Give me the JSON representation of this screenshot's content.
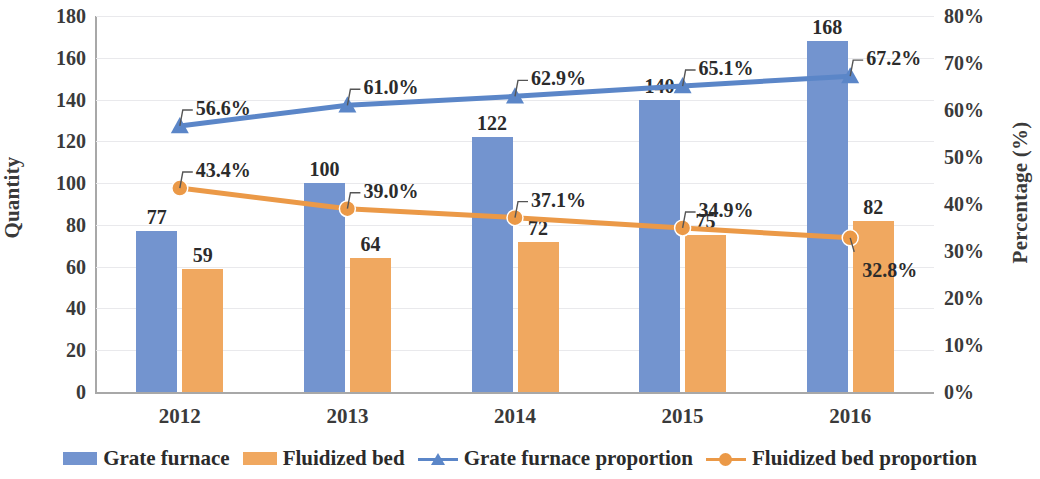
{
  "chart_data": {
    "type": "bar",
    "title": "",
    "subtitle": "",
    "xlabel": "",
    "ylabel": "Quantity",
    "y2label": "Percentage (%)",
    "categories": [
      "2012",
      "2013",
      "2014",
      "2015",
      "2016"
    ],
    "ylim": [
      0,
      180
    ],
    "y2lim": [
      0,
      80
    ],
    "yticks": [
      "180",
      "160",
      "140",
      "120",
      "100",
      "80",
      "60",
      "40",
      "20",
      "0"
    ],
    "ytick_values": [
      180,
      160,
      140,
      120,
      100,
      80,
      60,
      40,
      20,
      0
    ],
    "y2ticks": [
      "80%",
      "70%",
      "60%",
      "50%",
      "40%",
      "30%",
      "20%",
      "10%",
      "0%"
    ],
    "y2tick_values": [
      80,
      70,
      60,
      50,
      40,
      30,
      20,
      10,
      0
    ],
    "grid": true,
    "legend_position": "bottom",
    "series": [
      {
        "name": "Grate furnace",
        "type": "bar",
        "axis": "left",
        "color": "#7394cf",
        "values": [
          77,
          100,
          122,
          140,
          168
        ],
        "labels": [
          "77",
          "100",
          "122",
          "140",
          "168"
        ]
      },
      {
        "name": "Fluidized bed",
        "type": "bar",
        "axis": "left",
        "color": "#f0a860",
        "values": [
          59,
          64,
          72,
          75,
          82
        ],
        "labels": [
          "59",
          "64",
          "72",
          "75",
          "82"
        ]
      },
      {
        "name": "Grate furnace proportion",
        "type": "line",
        "axis": "right",
        "color": "#5b86c8",
        "marker": "triangle",
        "values": [
          56.6,
          61.0,
          62.9,
          65.1,
          67.2
        ],
        "labels": [
          "56.6%",
          "61.0%",
          "62.9%",
          "65.1%",
          "67.2%"
        ]
      },
      {
        "name": "Fluidized bed proportion",
        "type": "line",
        "axis": "right",
        "color": "#eb9947",
        "marker": "circle",
        "values": [
          43.4,
          39.0,
          37.1,
          34.9,
          32.8
        ],
        "labels": [
          "43.4%",
          "39.0%",
          "37.1%",
          "34.9%",
          "32.8%"
        ]
      }
    ]
  },
  "colors": {
    "bar_blue": "#7394cf",
    "bar_orange": "#f0a860",
    "line_blue": "#5b86c8",
    "line_orange": "#eb9947",
    "grid": "#e9e9ec",
    "axis": "#a8a8a8",
    "text": "#2b2b2b"
  }
}
